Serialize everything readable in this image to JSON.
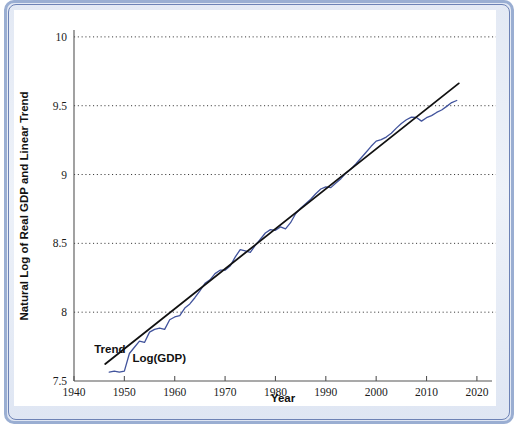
{
  "figure": {
    "frame_color": "#6d82b5",
    "background": "#ffffff"
  },
  "chart_data": {
    "type": "line",
    "title": "",
    "xlabel": "Year",
    "ylabel": "Natural Log of Real GDP and Linear Trend",
    "xlim": [
      1940,
      2023
    ],
    "ylim": [
      7.5,
      10.05
    ],
    "xticks": [
      1940,
      1950,
      1960,
      1970,
      1980,
      1990,
      2000,
      2010,
      2020
    ],
    "xtick_labels": [
      "1940",
      "1950",
      "1960",
      "1970",
      "1980",
      "1990",
      "2000",
      "2010",
      "2020"
    ],
    "yticks": [
      7.5,
      8,
      8.5,
      9,
      9.5,
      10
    ],
    "ytick_labels": [
      "7.5",
      "8",
      "8.5",
      "9",
      "9.5",
      "10"
    ],
    "grid": "horizontal-dotted",
    "legend_position": "inline-annotations",
    "annotations": [
      {
        "name": "trend-label",
        "text": "Trend",
        "x": 1944.0,
        "y": 7.705
      },
      {
        "name": "log-gdp-label",
        "text": "Log(GDP)",
        "x": 1951.6,
        "y": 7.635
      }
    ],
    "series": [
      {
        "name": "Log(GDP)",
        "color": "#41539c",
        "style": "solid",
        "width": 1.3,
        "x": [
          1947,
          1948,
          1949,
          1950,
          1951,
          1952,
          1953,
          1954,
          1955,
          1956,
          1957,
          1958,
          1959,
          1960,
          1961,
          1962,
          1963,
          1964,
          1965,
          1966,
          1967,
          1968,
          1969,
          1970,
          1971,
          1972,
          1973,
          1974,
          1975,
          1976,
          1977,
          1978,
          1979,
          1980,
          1981,
          1982,
          1983,
          1984,
          1985,
          1986,
          1987,
          1988,
          1989,
          1990,
          1991,
          1992,
          1993,
          1994,
          1995,
          1996,
          1997,
          1998,
          1999,
          2000,
          2001,
          2002,
          2003,
          2004,
          2005,
          2006,
          2007,
          2008,
          2009,
          2010,
          2011,
          2012,
          2013,
          2014,
          2015,
          2016
        ],
        "values": [
          7.565,
          7.572,
          7.565,
          7.572,
          7.7,
          7.745,
          7.79,
          7.78,
          7.855,
          7.875,
          7.885,
          7.875,
          7.945,
          7.965,
          7.975,
          8.03,
          8.06,
          8.105,
          8.155,
          8.21,
          8.235,
          8.28,
          8.305,
          8.305,
          8.335,
          8.4,
          8.455,
          8.445,
          8.435,
          8.485,
          8.53,
          8.575,
          8.6,
          8.595,
          8.62,
          8.605,
          8.65,
          8.715,
          8.755,
          8.788,
          8.82,
          8.86,
          8.895,
          8.91,
          8.905,
          8.938,
          8.97,
          9.01,
          9.04,
          9.078,
          9.12,
          9.162,
          9.205,
          9.243,
          9.253,
          9.272,
          9.3,
          9.337,
          9.371,
          9.398,
          9.417,
          9.415,
          9.388,
          9.413,
          9.428,
          9.451,
          9.469,
          9.495,
          9.523,
          9.538
        ]
      },
      {
        "name": "Trend",
        "color": "#111111",
        "style": "solid",
        "width": 1.8,
        "x": [
          1946.2,
          2016.4
        ],
        "values": [
          7.624,
          9.662
        ]
      }
    ]
  }
}
